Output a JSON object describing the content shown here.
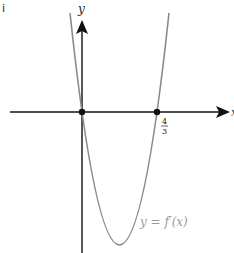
{
  "part_label": "i",
  "axes": {
    "x_label": "x",
    "y_label": "y"
  },
  "curve": {
    "label": "y = f′(x)",
    "color": "#8a8a8a"
  },
  "points": [
    {
      "name": "origin",
      "label": ""
    },
    {
      "name": "root-4-3",
      "label_num": "4",
      "label_den": "3"
    }
  ],
  "colors": {
    "axis": "#111111",
    "curve": "#8a8a8a",
    "label": "#9a9a9a"
  }
}
